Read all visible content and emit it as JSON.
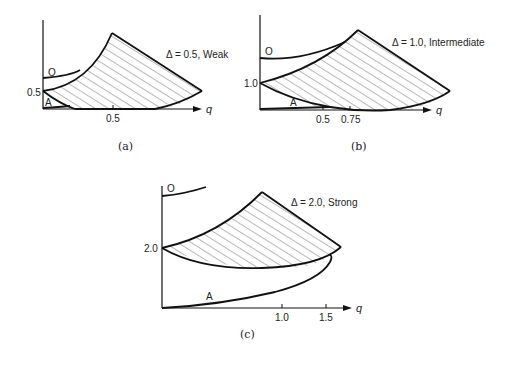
{
  "panels": [
    {
      "id": "a",
      "caption": "(a)",
      "annotation": "Δ = 0.5, Weak",
      "y_tick": "0.5",
      "x_ticks": [
        "0.5"
      ],
      "x_axis_label": "q",
      "curve_labels": {
        "upper": "O",
        "lower": "A"
      }
    },
    {
      "id": "b",
      "caption": "(b)",
      "annotation": "Δ = 1.0, Intermediate",
      "y_tick": "1.0",
      "x_ticks": [
        "0.5",
        "0.75"
      ],
      "x_axis_label": "q",
      "curve_labels": {
        "upper": "O",
        "lower": "A"
      }
    },
    {
      "id": "c",
      "caption": "(c)",
      "annotation": "Δ = 2.0, Strong",
      "y_tick": "2.0",
      "x_ticks": [
        "1.0",
        "1.5"
      ],
      "x_axis_label": "q",
      "curve_labels": {
        "upper": "O",
        "lower": "A"
      }
    }
  ]
}
